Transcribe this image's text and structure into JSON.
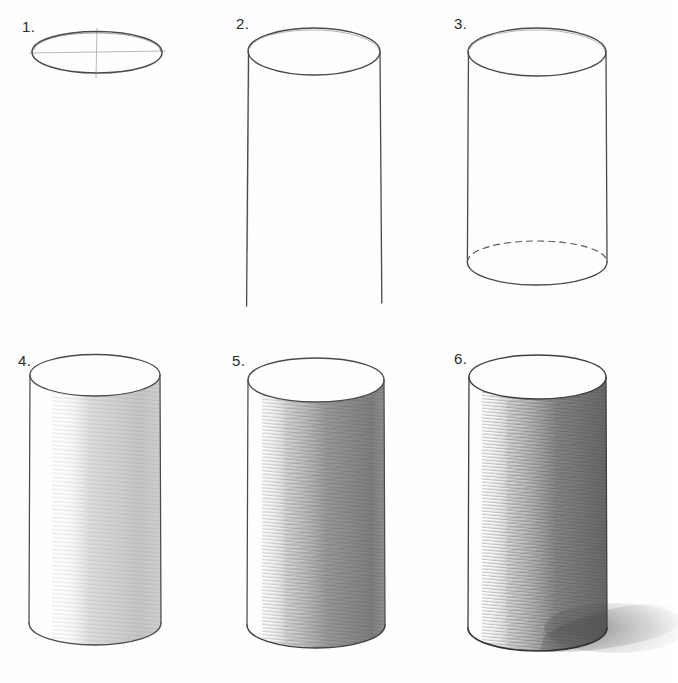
{
  "artwork": {
    "title": "Cylinder shading step-by-step pencil study",
    "medium": "graphite pencil on white paper",
    "paper_color": "#fefefe",
    "line_color": "#3a3a3a",
    "shadow_color": "#8c8c8c",
    "grid": {
      "columns": 3,
      "rows": 2
    }
  },
  "steps": [
    {
      "number": "1.",
      "label": "1.",
      "name": "ellipse-with-guide-lines",
      "description": "Flat ellipse with horizontal major axis and vertical minor axis construction lines",
      "has_top_ellipse": true,
      "has_side_lines": false,
      "has_bottom_ellipse": false,
      "has_guides": true,
      "shading_level": 0,
      "has_cast_shadow": false,
      "geometry": {
        "cx": 97,
        "cy": 52,
        "rx": 65,
        "ry": 21
      }
    },
    {
      "number": "2.",
      "label": "2.",
      "name": "top-ellipse-with-sides",
      "description": "Top ellipse with two vertical side contour lines, bottom still open",
      "has_top_ellipse": true,
      "has_side_lines": true,
      "has_bottom_ellipse": false,
      "has_guides": false,
      "shading_level": 0,
      "has_cast_shadow": false,
      "geometry": {
        "cx": 314,
        "cy": 51,
        "rx": 66,
        "ry": 23,
        "bottom_y": 306
      }
    },
    {
      "number": "3.",
      "label": "3.",
      "name": "closed-cylinder-dashed-back-edge",
      "description": "Completed cylinder; bottom ellipse back half drawn dashed as hidden edge, front half solid",
      "has_top_ellipse": true,
      "has_side_lines": true,
      "has_bottom_ellipse": true,
      "has_guides": false,
      "bottom_back_edge": "dashed",
      "shading_level": 0,
      "has_cast_shadow": false,
      "geometry": {
        "cx": 537,
        "cy": 52,
        "rx": 69,
        "ry": 24,
        "bottom_y": 278
      }
    },
    {
      "number": "4.",
      "label": "4.",
      "name": "first-pass-light-shading",
      "description": "Light first layer of hatching laid over the right side of the barrel",
      "has_top_ellipse": true,
      "has_side_lines": true,
      "has_bottom_ellipse": true,
      "has_guides": false,
      "bottom_back_edge": "hidden",
      "shading_level": 1,
      "has_cast_shadow": false,
      "geometry": {
        "cx": 95,
        "cy": 375,
        "rx": 65,
        "ry": 20,
        "bottom_y": 643
      }
    },
    {
      "number": "5.",
      "label": "5.",
      "name": "build-up-core-shadow",
      "description": "Darker hatching builds the core shadow band right of centre, leaving a highlight strip on the left",
      "has_top_ellipse": true,
      "has_side_lines": true,
      "has_bottom_ellipse": true,
      "has_guides": false,
      "bottom_back_edge": "hidden",
      "shading_level": 2,
      "has_cast_shadow": false,
      "geometry": {
        "cx": 316,
        "cy": 380,
        "rx": 68,
        "ry": 22,
        "bottom_y": 645
      }
    },
    {
      "number": "6.",
      "label": "6.",
      "name": "finished-cylinder-with-cast-shadow",
      "description": "Finished rendering with reflected light on the right rim and a cast shadow falling to the lower right",
      "has_top_ellipse": true,
      "has_side_lines": true,
      "has_bottom_ellipse": true,
      "has_guides": false,
      "bottom_back_edge": "hidden",
      "shading_level": 3,
      "has_cast_shadow": true,
      "cast_shadow_direction": "right",
      "geometry": {
        "cx": 537,
        "cy": 377,
        "rx": 68,
        "ry": 22,
        "bottom_y": 648
      }
    }
  ]
}
